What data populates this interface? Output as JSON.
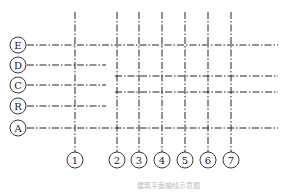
{
  "diagram": {
    "type": "structural-axis-grid",
    "caption": "建筑平面轴线示意图",
    "line_color": "#222222",
    "vertical_axes": [
      {
        "label": "1",
        "x": 75,
        "y_top": 12,
        "y_bottom": 152
      },
      {
        "label": "2",
        "x": 117,
        "y_top": 12,
        "y_bottom": 152
      },
      {
        "label": "3",
        "x": 139,
        "y_top": 12,
        "y_bottom": 152
      },
      {
        "label": "4",
        "x": 162,
        "y_top": 12,
        "y_bottom": 152
      },
      {
        "label": "5",
        "x": 185,
        "y_top": 12,
        "y_bottom": 152
      },
      {
        "label": "6",
        "x": 208,
        "y_top": 12,
        "y_bottom": 152
      },
      {
        "label": "7",
        "x": 231,
        "y_top": 12,
        "y_bottom": 152
      }
    ],
    "horizontal_axes": [
      {
        "label": "E",
        "y": 45,
        "x_start": 27,
        "x_end": 278
      },
      {
        "label": "D",
        "y": 65,
        "x_start": 27,
        "x_end": 106
      },
      {
        "label": "C",
        "y": 85,
        "x_start": 27,
        "x_end": 106
      },
      {
        "label": "R",
        "y": 106,
        "x_start": 27,
        "x_end": 106
      },
      {
        "label": "A",
        "y": 128,
        "x_start": 27,
        "x_end": 278
      }
    ],
    "secondary_lines": [
      {
        "y": 76,
        "x_start": 115,
        "x_end": 278
      },
      {
        "y": 92,
        "x_start": 115,
        "x_end": 278
      }
    ]
  }
}
